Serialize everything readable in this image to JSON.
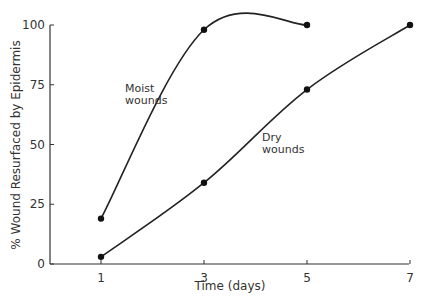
{
  "chart_data": {
    "type": "line",
    "title": "",
    "xlabel": "Time (days)",
    "ylabel": "% Wound Resurfaced by Epidermis",
    "x": [
      1,
      3,
      5,
      7
    ],
    "xticks": [
      "1",
      "3",
      "5",
      "7"
    ],
    "yticks": [
      "0",
      "25",
      "50",
      "75",
      "100"
    ],
    "xlim": [
      0,
      7
    ],
    "ylim": [
      0,
      100
    ],
    "grid": false,
    "legend": "none (inline labels)",
    "series": [
      {
        "name": "Moist wounds",
        "x": [
          1,
          3,
          5
        ],
        "values": [
          19,
          98,
          100
        ]
      },
      {
        "name": "Dry wounds",
        "x": [
          1,
          3,
          5,
          7
        ],
        "values": [
          3,
          34,
          73,
          100
        ]
      }
    ],
    "annotations": [
      {
        "text": "Moist\nwounds",
        "series": "Moist wounds"
      },
      {
        "text": "Dry\nwounds",
        "series": "Dry wounds"
      }
    ]
  }
}
